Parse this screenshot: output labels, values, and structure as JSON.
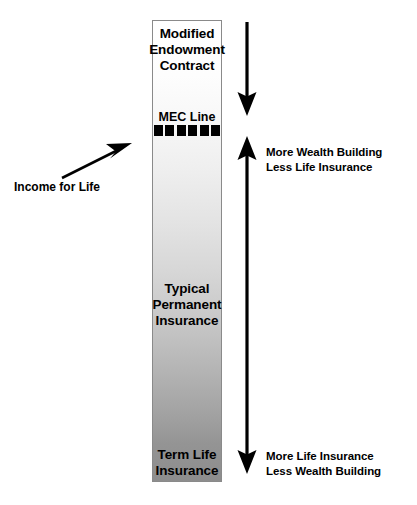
{
  "diagram": {
    "column": {
      "top_label": "Modified\nEndowment\nContract",
      "top_label_lines": [
        "Modified",
        "Endowment",
        "Contract"
      ],
      "middle_label_lines": [
        "Typical",
        "Permanent",
        "Insurance"
      ],
      "bottom_label_lines": [
        "Term Life",
        "Insurance"
      ],
      "gradient_top_color": "#ffffff",
      "gradient_bottom_color": "#8d8d8d",
      "border_color": "#8a8a8a"
    },
    "mec_line": {
      "label": "MEC Line",
      "dash_count": 6,
      "dash_color": "#000000"
    },
    "annotations": {
      "income_for_life": "Income for Life",
      "top_right_line1": "More Wealth Building",
      "top_right_line2": "Less Life Insurance",
      "bottom_right_line1": "More Life Insurance",
      "bottom_right_line2": "Less Wealth Building"
    },
    "arrows": {
      "down_arrow_name": "down-arrow-to-mec",
      "double_arrow_name": "double-headed-vertical-arrow",
      "pointer_arrow_name": "income-for-life-pointer-arrow",
      "color": "#000000"
    }
  }
}
